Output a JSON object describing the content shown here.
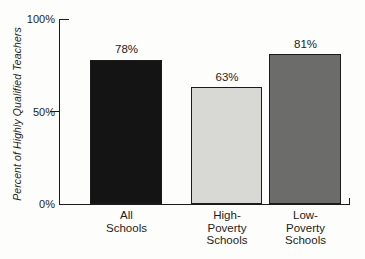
{
  "chart_data": {
    "type": "bar",
    "title": "",
    "ylabel": "Percent of Highly Qualified Teachers",
    "xlabel": "",
    "ylim": [
      0,
      100
    ],
    "grid": false,
    "legend": false,
    "yticks": [
      {
        "value": 100,
        "label": "100%"
      },
      {
        "value": 50,
        "label": "50%"
      },
      {
        "value": 0,
        "label": "0%"
      }
    ],
    "categories": [
      "All\nSchools",
      "High-\nPoverty\nSchools",
      "Low-\nPoverty\nSchools"
    ],
    "values": [
      78,
      63,
      81
    ],
    "value_labels": [
      "78%",
      "63%",
      "81%"
    ],
    "bar_colors": [
      "#141414",
      "#d8d8d5",
      "#6c6c6a"
    ],
    "bar_border_color": "#1b1b1b",
    "axis_color": "#1b1b1b",
    "text_color": "#1e1c1c",
    "background_color": "#fdfdfb"
  }
}
